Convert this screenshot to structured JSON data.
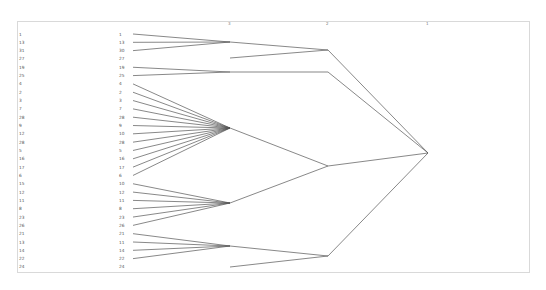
{
  "title": "",
  "axis": {
    "levels": [
      "3",
      "2",
      "1"
    ]
  },
  "labels_left": [
    "1",
    "13",
    "31",
    "27",
    "19",
    "25",
    "4",
    "2",
    "3",
    "7",
    "28",
    "9",
    "12",
    "28",
    "5",
    "16",
    "17",
    "6",
    "15",
    "12",
    "11",
    "8",
    "23",
    "26",
    "21",
    "13",
    "14",
    "22",
    "24"
  ],
  "labels_mid": [
    "1",
    "13",
    "30",
    "27",
    "19",
    "25",
    "4",
    "2",
    "3",
    "7",
    "28",
    "9",
    "10",
    "28",
    "5",
    "16",
    "17",
    "6",
    "10",
    "12",
    "11",
    "8",
    "23",
    "26",
    "21",
    "11",
    "14",
    "22",
    "24"
  ],
  "tree": {
    "level3_nodes": [
      {
        "id": "A",
        "x": 230,
        "y": 42,
        "children": [
          0,
          1,
          2
        ]
      },
      {
        "id": "B",
        "x": 230,
        "y": 72,
        "children": [
          4,
          5
        ]
      },
      {
        "id": "C",
        "x": 230,
        "y": 128,
        "children": [
          6,
          7,
          8,
          9,
          10,
          11,
          12,
          13,
          14,
          15,
          16,
          17
        ]
      },
      {
        "id": "D",
        "x": 230,
        "y": 203,
        "children": [
          18,
          19,
          20,
          21,
          22,
          23
        ]
      },
      {
        "id": "E",
        "x": 230,
        "y": 246,
        "children": [
          24,
          25,
          26,
          27
        ]
      }
    ],
    "level2_nodes": [
      {
        "id": "P",
        "x": 328,
        "y": 50,
        "from": [
          {
            "x": 230,
            "y": 42
          },
          {
            "x": 230,
            "y": 58
          }
        ]
      },
      {
        "id": "Q",
        "x": 328,
        "y": 72,
        "from": [
          {
            "x": 230,
            "y": 72
          }
        ]
      },
      {
        "id": "R",
        "x": 328,
        "y": 166,
        "from": [
          {
            "x": 230,
            "y": 128
          },
          {
            "x": 230,
            "y": 203
          }
        ]
      },
      {
        "id": "S",
        "x": 328,
        "y": 256,
        "from": [
          {
            "x": 230,
            "y": 246
          },
          {
            "x": 230,
            "y": 267
          }
        ]
      }
    ],
    "root": {
      "x": 428,
      "y": 153
    }
  },
  "colors": {
    "line": "#555555",
    "frame": "#d9d9d9",
    "label": "#555555"
  }
}
